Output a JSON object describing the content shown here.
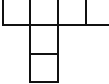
{
  "diagram": {
    "type": "cube-net",
    "stroke_color": "#111111",
    "fill_color": "#ffffff",
    "cells": [
      {
        "row": 0,
        "col": 0
      },
      {
        "row": 0,
        "col": 1
      },
      {
        "row": 0,
        "col": 2
      },
      {
        "row": 0,
        "col": 3
      },
      {
        "row": 1,
        "col": 1
      },
      {
        "row": 2,
        "col": 1
      }
    ]
  }
}
